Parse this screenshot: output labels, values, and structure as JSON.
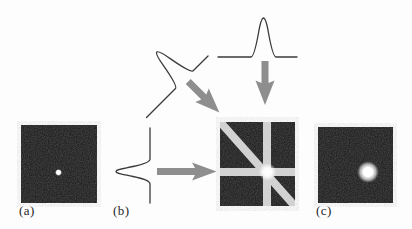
{
  "figure": {
    "panels": {
      "a": {
        "label": "(a)"
      },
      "b": {
        "label": "(b)"
      },
      "c": {
        "label": "(c)"
      }
    }
  },
  "colors": {
    "background": "#fdfdfd",
    "square_fill": "#181818",
    "band_light": "#d2d2d2",
    "arrow_gray": "#8e8e8e",
    "curve_stroke": "#3a3a3a",
    "dot_white": "#ffffff",
    "label_text": "#1f1f1f"
  }
}
